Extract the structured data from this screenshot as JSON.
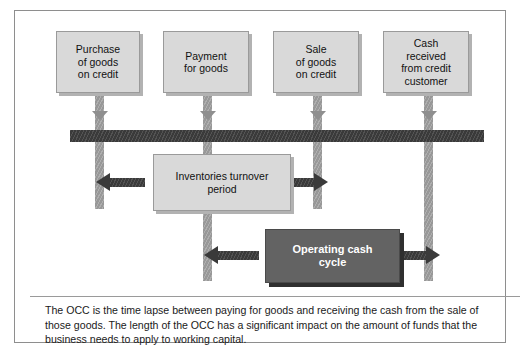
{
  "figure": {
    "events": [
      {
        "id": "purchase",
        "lines": [
          "Purchase",
          "of goods",
          "on credit"
        ]
      },
      {
        "id": "payment",
        "lines": [
          "Payment",
          "for goods"
        ]
      },
      {
        "id": "sale",
        "lines": [
          "Sale",
          "of goods",
          "on credit"
        ]
      },
      {
        "id": "cash-received",
        "lines": [
          "Cash",
          "received",
          "from credit",
          "customer"
        ]
      }
    ],
    "periods": [
      {
        "id": "inventories-turnover-period",
        "lines": [
          "Inventories turnover",
          "period"
        ]
      },
      {
        "id": "operating-cash-cycle",
        "lines": [
          "Operating cash",
          "cycle"
        ]
      }
    ],
    "caption": "The OCC is the time lapse between paying for goods and receiving the cash from the sale of those goods. The length of the OCC has a significant impact on the amount of funds that the business needs to apply to working capital.",
    "colors": {
      "event_box_fill": "#d9d9d9",
      "event_box_border": "#9a9a9a",
      "timeline_fill": "#3a3a3a",
      "dropper_fill": "#989898",
      "occ_box_fill": "#636363",
      "occ_box_text": "#ffffff",
      "frame_border": "#8e8e8e",
      "page_background": "#ffffff"
    }
  }
}
